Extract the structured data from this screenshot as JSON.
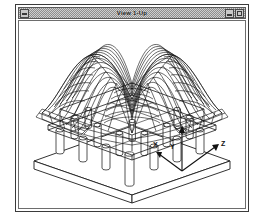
{
  "window": {
    "title": "View 1-Up",
    "system_menu_icon": "system-menu-icon",
    "minimize_icon": "minimize-icon",
    "maximize_icon": "maximize-icon"
  },
  "viewport": {
    "name": "3d-model-viewport",
    "model_description": "Deformed finite-element plate supported on columns over a rectangular base slab",
    "render_mode": "wireframe"
  },
  "axes": {
    "x_label": "X",
    "y_label": "Y",
    "z_label": "Z"
  },
  "colors": {
    "line": "#1c1c1c",
    "background": "#ffffff",
    "frame": "#3b3b3b",
    "titlebar": "#cfcfcf"
  }
}
